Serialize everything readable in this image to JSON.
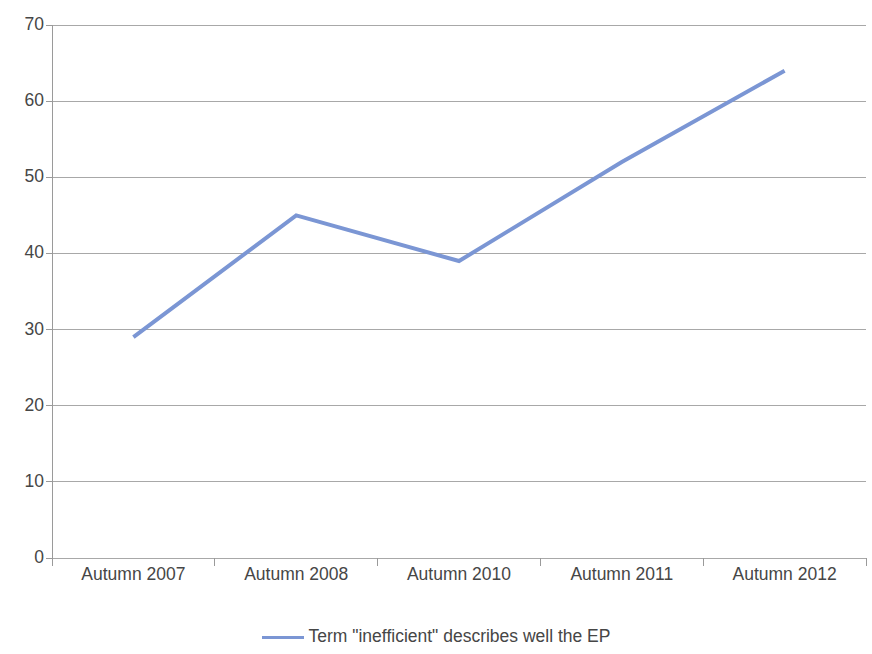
{
  "chart_data": {
    "type": "line",
    "title": "",
    "subtitle": "",
    "xlabel": "",
    "ylabel": "",
    "categories": [
      "Autumn 2007",
      "Autumn 2008",
      "Autumn 2010",
      "Autumn 2011",
      "Autumn 2012"
    ],
    "series": [
      {
        "name": "Term \"inefficient\" describes well the EP",
        "values": [
          29,
          45,
          39,
          52,
          64
        ],
        "color": "#7b96d4"
      }
    ],
    "ylim": [
      0,
      70
    ],
    "yticks": [
      0,
      10,
      20,
      30,
      40,
      50,
      60,
      70
    ],
    "ytick_labels": [
      "0",
      "10",
      "20",
      "30",
      "40",
      "50",
      "60",
      "70"
    ],
    "grid": true,
    "grid_axis": "y",
    "legend_position": "bottom",
    "background_color": "#ffffff",
    "grid_color": "#9a9a9a",
    "axis_color": "#9a9a9a"
  }
}
